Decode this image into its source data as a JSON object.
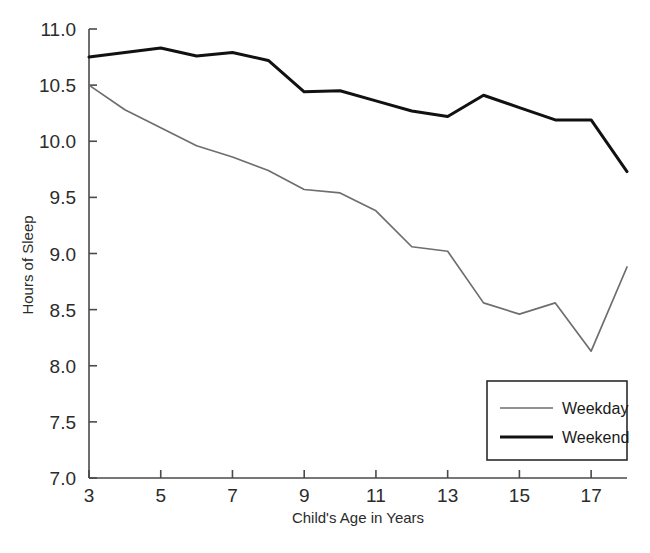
{
  "chart_data": {
    "type": "line",
    "title": "",
    "xlabel": "Child's Age in Years",
    "ylabel": "Hours of Sleep",
    "xlim": [
      3,
      18
    ],
    "ylim": [
      7.0,
      11.0
    ],
    "grid": false,
    "legend_position": "bottom-right",
    "x": [
      3,
      4,
      5,
      6,
      7,
      8,
      9,
      10,
      11,
      12,
      13,
      14,
      15,
      16,
      17,
      18
    ],
    "xticks": [
      3,
      5,
      7,
      9,
      11,
      13,
      15,
      17
    ],
    "xtick_labels": [
      "3",
      "5",
      "7",
      "9",
      "11",
      "13",
      "15",
      "17"
    ],
    "yticks": [
      7.0,
      7.5,
      8.0,
      8.5,
      9.0,
      9.5,
      10.0,
      10.5,
      11.0
    ],
    "ytick_labels": [
      "7.0",
      "7.5",
      "8.0",
      "8.5",
      "9.0",
      "9.5",
      "10.0",
      "10.5",
      "11.0"
    ],
    "series": [
      {
        "name": "Weekday",
        "color": "#6e6e6e",
        "width": 1.7,
        "values": [
          10.5,
          10.28,
          10.12,
          9.96,
          9.86,
          9.74,
          9.57,
          9.54,
          9.38,
          9.06,
          9.02,
          8.56,
          8.46,
          8.56,
          8.13,
          8.88
        ]
      },
      {
        "name": "Weekend",
        "color": "#111111",
        "width": 3.0,
        "values": [
          10.75,
          10.79,
          10.83,
          10.76,
          10.79,
          10.72,
          10.44,
          10.45,
          10.36,
          10.27,
          10.22,
          10.41,
          10.3,
          10.19,
          10.19,
          9.73
        ]
      }
    ]
  },
  "legend": {
    "items": [
      {
        "label": "Weekday"
      },
      {
        "label": "Weekend"
      }
    ]
  },
  "axes": {
    "x_title": "Child's Age in Years",
    "y_title": "Hours of Sleep"
  }
}
